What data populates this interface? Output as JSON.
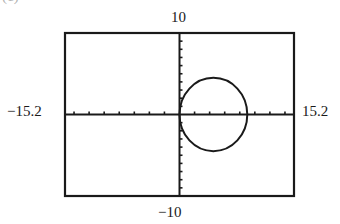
{
  "panel_label": "(c)",
  "chart_data": {
    "type": "line",
    "title": "",
    "xlabel": "",
    "ylabel": "",
    "xlim": [
      -15.2,
      15.2
    ],
    "ylim": [
      -10,
      10
    ],
    "xscl": 2,
    "yscl": 1,
    "grid": false,
    "axes_through_origin": true,
    "tick_labels": {
      "xmin": "−15.2",
      "xmax": "15.2",
      "ymin": "−10",
      "ymax": "10"
    },
    "series": [
      {
        "name": "circle",
        "shape": "circle",
        "center": [
          4.5,
          0
        ],
        "radius": 4.5,
        "description": "Circle tangent to the y-axis at the origin (r = 9cosθ)"
      }
    ]
  },
  "colors": {
    "frame": "#1a1a1a",
    "curve": "#1a1a1a",
    "background": "#ffffff"
  }
}
